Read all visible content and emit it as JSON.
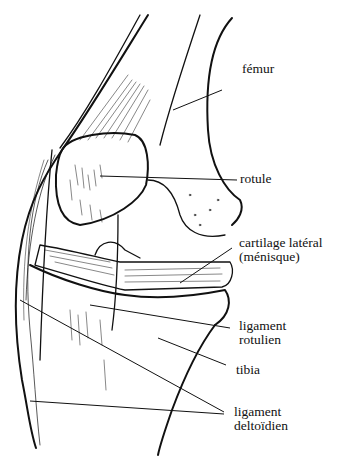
{
  "figure": {
    "ink_color": "#111111",
    "background": "#ffffff"
  },
  "labels": [
    {
      "id": "femur",
      "lines": [
        "fémur"
      ],
      "x": 242,
      "y": 62
    },
    {
      "id": "rotule",
      "lines": [
        "rotule"
      ],
      "x": 240,
      "y": 172
    },
    {
      "id": "cartilage",
      "lines": [
        "cartilage latéral",
        "(ménisque)"
      ],
      "x": 239,
      "y": 236
    },
    {
      "id": "ligament-rotulien",
      "lines": [
        "ligament",
        "rotulien"
      ],
      "x": 239,
      "y": 319
    },
    {
      "id": "tibia",
      "lines": [
        "tibia"
      ],
      "x": 236,
      "y": 363
    },
    {
      "id": "ligament-deltoidien",
      "lines": [
        "ligament",
        "deltoïdien"
      ],
      "x": 234,
      "y": 405
    }
  ]
}
